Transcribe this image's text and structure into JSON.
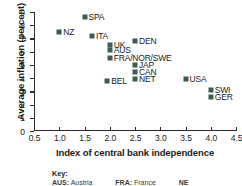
{
  "chart_data": {
    "type": "scatter",
    "title": "",
    "xlabel": "Index of central bank independence",
    "ylabel": "Average inflation (percent)",
    "xlim": [
      0.5,
      4.5
    ],
    "ylim": [
      0,
      9
    ],
    "xticks": [
      "0.5",
      "1.0",
      "1.5",
      "2.0",
      "2.5",
      "3.0",
      "3.5",
      "4.0",
      "4.5"
    ],
    "xtick_values": [
      0.5,
      1.0,
      1.5,
      2.0,
      2.5,
      3.0,
      3.5,
      4.0,
      4.5
    ],
    "yticks": [
      "0",
      "1",
      "2",
      "3",
      "4",
      "5",
      "6",
      "7",
      "8",
      "9"
    ],
    "ytick_values": [
      0,
      1,
      2,
      3,
      4,
      5,
      6,
      7,
      8,
      9
    ],
    "grid": false,
    "legend": "none",
    "marker_color": "#3f5a4e",
    "points": [
      {
        "label": "SPA",
        "x": 1.5,
        "y": 8.6,
        "label_side": "right"
      },
      {
        "label": "NZ",
        "x": 1.0,
        "y": 7.5,
        "label_side": "right"
      },
      {
        "label": "ITA",
        "x": 1.65,
        "y": 7.2,
        "label_side": "right"
      },
      {
        "label": "DEN",
        "x": 2.5,
        "y": 6.8,
        "label_side": "right"
      },
      {
        "label": "UK",
        "x": 2.0,
        "y": 6.5,
        "label_side": "right"
      },
      {
        "label": "AUS",
        "x": 2.0,
        "y": 6.1,
        "label_side": "right"
      },
      {
        "label": "FRA/NOR/SWE",
        "x": 2.0,
        "y": 5.5,
        "label_side": "right"
      },
      {
        "label": "JAP",
        "x": 2.5,
        "y": 5.0,
        "label_side": "right"
      },
      {
        "label": "CAN",
        "x": 2.5,
        "y": 4.5,
        "label_side": "right"
      },
      {
        "label": "NET",
        "x": 2.5,
        "y": 3.9,
        "label_side": "right"
      },
      {
        "label": "USA",
        "x": 3.5,
        "y": 3.9,
        "label_side": "right"
      },
      {
        "label": "BEL",
        "x": 1.95,
        "y": 3.8,
        "label_side": "right"
      },
      {
        "label": "SWI",
        "x": 4.0,
        "y": 3.1,
        "label_side": "right"
      },
      {
        "label": "GER",
        "x": 4.0,
        "y": 2.6,
        "label_side": "right"
      }
    ]
  },
  "key": {
    "title": "Key:",
    "entries": [
      {
        "abbr": "AUS:",
        "name": "Austria"
      },
      {
        "abbr": "FRA:",
        "name": "France"
      },
      {
        "abbr": "NE",
        "name": ""
      }
    ]
  }
}
